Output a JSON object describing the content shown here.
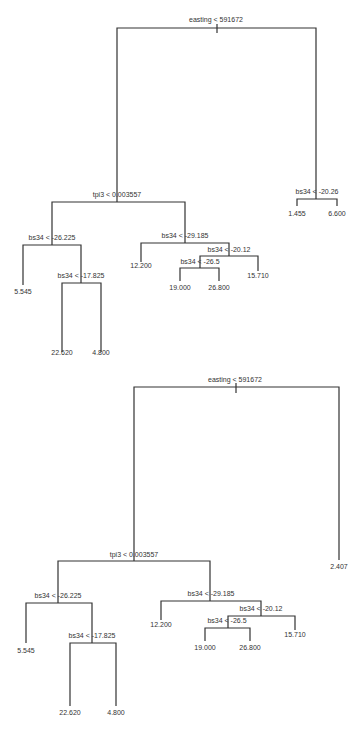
{
  "trees": [
    {
      "id": "top",
      "nodes": {
        "root": {
          "label": "easting < 591672"
        },
        "n_tpi3": {
          "label": "tpi3 < 0.003557"
        },
        "n_bs34_a": {
          "label": "bs34 < -26.225"
        },
        "n_bs34_b": {
          "label": "bs34 < -17.825"
        },
        "n_bs34_c": {
          "label": "bs34 < -29.185"
        },
        "n_bs34_d": {
          "label": "bs34 < -20.12"
        },
        "n_bs34_e": {
          "label": "bs34 < -26.5"
        },
        "n_bs34_f": {
          "label": "bs34 < -20.26"
        }
      },
      "leaves": {
        "l1": "5.545",
        "l2": "22.620",
        "l3": "4.800",
        "l4": "12.200",
        "l5": "19.000",
        "l6": "26.800",
        "l7": "15.710",
        "l8": "1.455",
        "l9": "6.600"
      }
    },
    {
      "id": "bottom",
      "nodes": {
        "root": {
          "label": "easting < 591672"
        },
        "n_tpi3": {
          "label": "tpi3 < 0.003557"
        },
        "n_bs34_a": {
          "label": "bs34 < -26.225"
        },
        "n_bs34_b": {
          "label": "bs34 < -17.825"
        },
        "n_bs34_c": {
          "label": "bs34 < -29.185"
        },
        "n_bs34_d": {
          "label": "bs34 < -20.12"
        },
        "n_bs34_e": {
          "label": "bs34 < -26.5"
        }
      },
      "leaves": {
        "l1": "5.545",
        "l2": "22.620",
        "l3": "4.800",
        "l4": "12.200",
        "l5": "19.000",
        "l6": "26.800",
        "l7": "15.710",
        "l8": "2.407"
      }
    }
  ]
}
